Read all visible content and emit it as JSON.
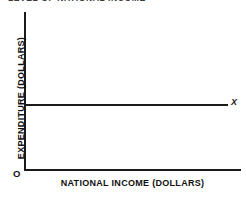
{
  "figure": {
    "title": "LEVEL OF NATIONAL INCOME",
    "origin_label": "O"
  },
  "chart_data": {
    "type": "line",
    "title": "LEVEL OF NATIONAL INCOME",
    "xlabel": "NATIONAL INCOME (DOLLARS)",
    "ylabel": "EXPENDITURE (DOLLARS)",
    "grid": false,
    "legend": "none",
    "axis_origin_label": "O",
    "xlim": [
      0,
      100
    ],
    "ylim": [
      0,
      100
    ],
    "xticks": [],
    "yticks": [],
    "series": [
      {
        "name": "X",
        "label": "X",
        "label_position": "right-end",
        "description": "Constant autonomous expenditure, horizontal at y = 41",
        "x": [
          0,
          100
        ],
        "values": [
          41,
          41
        ],
        "color": "#1a1a1a"
      }
    ]
  }
}
